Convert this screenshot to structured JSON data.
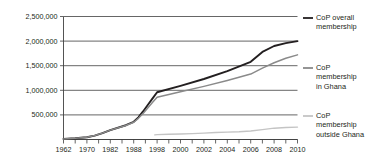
{
  "chart_data": {
    "type": "line",
    "title": "",
    "xlabel": "",
    "ylabel": "",
    "xlim": [
      1962,
      2010
    ],
    "ylim": [
      0,
      2500000
    ],
    "grid": true,
    "legend_position": "right",
    "y_ticks": [
      0,
      500000,
      1000000,
      1500000,
      2000000,
      2500000
    ],
    "y_tick_labels": [
      "",
      "500,000",
      "1,000,000",
      "1,500,000",
      "2,000,000",
      "2,500,000"
    ],
    "x_tick_labels": [
      "1962",
      "1970",
      "1982",
      "1988",
      "1998",
      "2000",
      "2002",
      "2004",
      "2006",
      "2008",
      "2010"
    ],
    "x_tick_values": [
      1962,
      1970,
      1982,
      1988,
      1998,
      2000,
      2002,
      2004,
      2006,
      2008,
      2010
    ],
    "series": [
      {
        "name": "CoP overall membership",
        "color": "#231f20",
        "x": [
          1962,
          1966,
          1970,
          1974,
          1978,
          1982,
          1986,
          1988,
          1990,
          1992,
          1994,
          1996,
          1998,
          2000,
          2002,
          2004,
          2006,
          2007,
          2008,
          2009,
          2010
        ],
        "values": [
          12000,
          25000,
          45000,
          80000,
          130000,
          190000,
          290000,
          360000,
          450000,
          570000,
          700000,
          830000,
          960000,
          1090000,
          1230000,
          1390000,
          1580000,
          1780000,
          1900000,
          1960000,
          2000000
        ]
      },
      {
        "name": "CoP membership in Ghana",
        "color": "#8a8a8a",
        "x": [
          1962,
          1966,
          1970,
          1974,
          1978,
          1982,
          1986,
          1988,
          1990,
          1992,
          1994,
          1996,
          1998,
          2000,
          2002,
          2004,
          2006,
          2007,
          2008,
          2009,
          2010
        ],
        "values": [
          12000,
          25000,
          45000,
          80000,
          130000,
          190000,
          285000,
          350000,
          430000,
          530000,
          640000,
          750000,
          860000,
          970000,
          1080000,
          1200000,
          1330000,
          1450000,
          1560000,
          1650000,
          1720000
        ]
      },
      {
        "name": "CoP membership outside Ghana",
        "color": "#c4c4c4",
        "x": [
          1997,
          1998,
          1999,
          2000,
          2001,
          2002,
          2003,
          2004,
          2005,
          2006,
          2007,
          2008,
          2009,
          2010
        ],
        "values": [
          95000,
          100000,
          106000,
          112000,
          120000,
          130000,
          142000,
          150000,
          158000,
          172000,
          200000,
          230000,
          245000,
          252000
        ]
      }
    ]
  },
  "legend": {
    "items": [
      {
        "label_line1": "CoP overall",
        "label_line2": "membership",
        "label_line3": "",
        "color": "#231f20"
      },
      {
        "label_line1": "CoP",
        "label_line2": "membership",
        "label_line3": "in Ghana",
        "color": "#8a8a8a"
      },
      {
        "label_line1": "CoP",
        "label_line2": "membership",
        "label_line3": "outside Ghana",
        "color": "#c4c4c4"
      }
    ]
  }
}
